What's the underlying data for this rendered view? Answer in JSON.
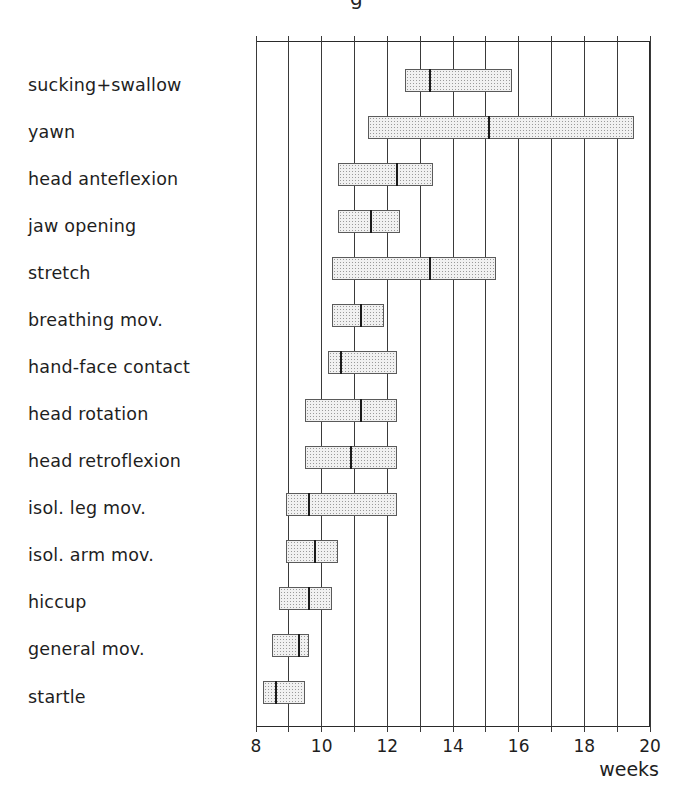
{
  "caption_fragment": "g",
  "chart_data": {
    "type": "bar",
    "subtype": "horizontal-range-with-median",
    "title": "",
    "xlabel": "weeks",
    "ylabel": "",
    "xlim": [
      8,
      20
    ],
    "x_ticks": [
      8,
      10,
      12,
      14,
      16,
      18,
      20
    ],
    "x_gridlines": [
      8,
      9,
      10,
      11,
      12,
      13,
      14,
      15,
      16,
      17,
      18,
      19,
      20
    ],
    "grid": true,
    "legend": null,
    "categories": [
      "sucking+swallow",
      "yawn",
      "head anteflexion",
      "jaw opening",
      "stretch",
      "breathing mov.",
      "hand-face contact",
      "head rotation",
      "head retroflexion",
      "isol. leg mov.",
      "isol. arm mov.",
      "hiccup",
      "general mov.",
      "startle"
    ],
    "series": [
      {
        "name": "start",
        "values": [
          12.55,
          11.4,
          10.5,
          10.5,
          10.3,
          10.3,
          10.2,
          9.5,
          9.5,
          8.9,
          8.9,
          8.7,
          8.5,
          8.2
        ]
      },
      {
        "name": "median",
        "values": [
          13.3,
          15.1,
          12.3,
          11.5,
          13.3,
          11.2,
          10.6,
          11.2,
          10.9,
          9.6,
          9.8,
          9.6,
          9.3,
          8.6
        ]
      },
      {
        "name": "end",
        "values": [
          15.8,
          19.5,
          13.4,
          12.4,
          15.3,
          11.9,
          12.3,
          12.3,
          12.3,
          12.3,
          10.5,
          10.3,
          9.6,
          9.5
        ]
      }
    ],
    "rows": [
      {
        "label": "sucking+swallow",
        "start": 12.55,
        "median": 13.3,
        "end": 15.8
      },
      {
        "label": "yawn",
        "start": 11.4,
        "median": 15.1,
        "end": 19.5
      },
      {
        "label": "head anteflexion",
        "start": 10.5,
        "median": 12.3,
        "end": 13.4
      },
      {
        "label": "jaw opening",
        "start": 10.5,
        "median": 11.5,
        "end": 12.4
      },
      {
        "label": "stretch",
        "start": 10.3,
        "median": 13.3,
        "end": 15.3
      },
      {
        "label": "breathing mov.",
        "start": 10.3,
        "median": 11.2,
        "end": 11.9
      },
      {
        "label": "hand-face contact",
        "start": 10.2,
        "median": 10.6,
        "end": 12.3
      },
      {
        "label": "head rotation",
        "start": 9.5,
        "median": 11.2,
        "end": 12.3
      },
      {
        "label": "head retroflexion",
        "start": 9.5,
        "median": 10.9,
        "end": 12.3
      },
      {
        "label": "isol. leg mov.",
        "start": 8.9,
        "median": 9.6,
        "end": 12.3
      },
      {
        "label": "isol. arm mov.",
        "start": 8.9,
        "median": 9.8,
        "end": 10.5
      },
      {
        "label": "hiccup",
        "start": 8.7,
        "median": 9.6,
        "end": 10.3
      },
      {
        "label": "general mov.",
        "start": 8.5,
        "median": 9.3,
        "end": 9.6
      },
      {
        "label": "startle",
        "start": 8.2,
        "median": 8.6,
        "end": 9.5
      }
    ],
    "colors": {
      "bar_fill": "#e8e8e8",
      "bar_border": "#5a5a5a",
      "median_line": "#1a1a1a",
      "gridline": "#3a3a3a"
    }
  }
}
